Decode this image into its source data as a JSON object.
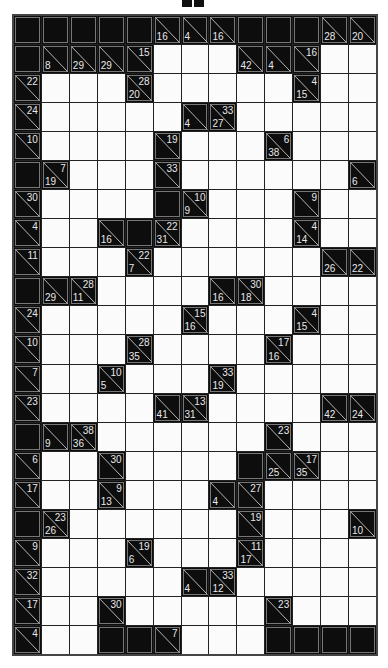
{
  "puzzle": {
    "type": "kakuro",
    "cols": 13,
    "rows": 22,
    "legend": "B = blocked cell, W = empty white cell, {d,r} = clue cell (down sum bottom-left, right sum top-right)",
    "grid": [
      [
        "B",
        "B",
        "B",
        "B",
        "B",
        {
          "d": 16
        },
        {
          "d": 4
        },
        {
          "d": 16
        },
        "B",
        "B",
        "B",
        {
          "d": 28
        },
        {
          "d": 20
        }
      ],
      [
        "B",
        {
          "d": 8
        },
        {
          "d": 29
        },
        {
          "d": 29
        },
        {
          "r": 15
        },
        "W",
        "W",
        "W",
        {
          "d": 42
        },
        {
          "d": 4
        },
        {
          "r": 16
        },
        "W",
        "W"
      ],
      [
        {
          "r": 22
        },
        "W",
        "W",
        "W",
        {
          "d": 20,
          "r": 28
        },
        "W",
        "W",
        "W",
        "W",
        "W",
        {
          "d": 15,
          "r": 4
        },
        "W",
        "W"
      ],
      [
        {
          "r": 24
        },
        "W",
        "W",
        "W",
        "W",
        "W",
        {
          "d": 4
        },
        {
          "d": 27,
          "r": 33
        },
        "W",
        "W",
        "W",
        "W",
        "W"
      ],
      [
        {
          "r": 10
        },
        "W",
        "W",
        "W",
        "W",
        {
          "r": 19
        },
        "W",
        "W",
        "W",
        {
          "d": 38,
          "r": 6
        },
        "W",
        "W",
        "W"
      ],
      [
        "B",
        {
          "d": 19,
          "r": 7
        },
        "W",
        "W",
        "W",
        {
          "r": 33
        },
        "W",
        "W",
        "W",
        "W",
        "W",
        "W",
        {
          "d": 6
        }
      ],
      [
        {
          "r": 30
        },
        "W",
        "W",
        "W",
        "W",
        "B",
        {
          "d": 9,
          "r": 10
        },
        "W",
        "W",
        "W",
        {
          "r": 9
        },
        "W",
        "W"
      ],
      [
        {
          "r": 4
        },
        "W",
        "W",
        {
          "d": 16
        },
        "B",
        {
          "d": 31,
          "r": 22
        },
        "W",
        "W",
        "W",
        "W",
        {
          "d": 14,
          "r": 4
        },
        "W",
        "W"
      ],
      [
        {
          "r": 11
        },
        "W",
        "W",
        "W",
        {
          "d": 7,
          "r": 22
        },
        "W",
        "W",
        "W",
        "W",
        "W",
        "W",
        {
          "d": 26
        },
        {
          "d": 22
        }
      ],
      [
        "B",
        {
          "d": 29
        },
        {
          "d": 11,
          "r": 28
        },
        "W",
        "W",
        "W",
        "W",
        {
          "d": 16
        },
        {
          "d": 18,
          "r": 30
        },
        "W",
        "W",
        "W",
        "W"
      ],
      [
        {
          "r": 24
        },
        "W",
        "W",
        "W",
        "W",
        "W",
        {
          "d": 16,
          "r": 15
        },
        "W",
        "W",
        "W",
        {
          "d": 15,
          "r": 4
        },
        "W",
        "W"
      ],
      [
        {
          "r": 10
        },
        "W",
        "W",
        "W",
        {
          "d": 35,
          "r": 28
        },
        "W",
        "W",
        "W",
        "W",
        {
          "d": 16,
          "r": 17
        },
        "W",
        "W",
        "W"
      ],
      [
        {
          "r": 7
        },
        "W",
        "W",
        {
          "d": 5,
          "r": 10
        },
        "W",
        "W",
        "W",
        {
          "d": 19,
          "r": 33
        },
        "W",
        "W",
        "W",
        "W",
        "W"
      ],
      [
        {
          "r": 23
        },
        "W",
        "W",
        "W",
        "W",
        {
          "d": 41
        },
        {
          "d": 31,
          "r": 13
        },
        "W",
        "W",
        "W",
        "W",
        {
          "d": 42
        },
        {
          "d": 24
        }
      ],
      [
        "B",
        {
          "d": 9
        },
        {
          "d": 36,
          "r": 38
        },
        "W",
        "W",
        "W",
        "W",
        "W",
        "W",
        {
          "r": 23
        },
        "W",
        "W",
        "W"
      ],
      [
        {
          "r": 6
        },
        "W",
        "W",
        {
          "r": 30
        },
        "W",
        "W",
        "W",
        "W",
        "B",
        {
          "d": 25
        },
        {
          "d": 35,
          "r": 17
        },
        "W",
        "W"
      ],
      [
        {
          "r": 17
        },
        "W",
        "W",
        {
          "d": 13,
          "r": 9
        },
        "W",
        "W",
        "W",
        {
          "d": 4
        },
        {
          "r": 27
        },
        "W",
        "W",
        "W",
        "W"
      ],
      [
        "B",
        {
          "d": 26,
          "r": 23
        },
        "W",
        "W",
        "W",
        "W",
        "W",
        "W",
        {
          "r": 19
        },
        "W",
        "W",
        "W",
        {
          "d": 10
        }
      ],
      [
        {
          "r": 9
        },
        "W",
        "W",
        "W",
        {
          "d": 6,
          "r": 19
        },
        "W",
        "W",
        "W",
        {
          "d": 17,
          "r": 11
        },
        "W",
        "W",
        "W",
        "W"
      ],
      [
        {
          "r": 32
        },
        "W",
        "W",
        "W",
        "W",
        "W",
        {
          "d": 4
        },
        {
          "d": 12,
          "r": 33
        },
        "W",
        "W",
        "W",
        "W",
        "W"
      ],
      [
        {
          "r": 17
        },
        "W",
        "W",
        {
          "r": 30
        },
        "W",
        "W",
        "W",
        "W",
        "W",
        {
          "r": 23
        },
        "W",
        "W",
        "W"
      ],
      [
        {
          "r": 4
        },
        "W",
        "W",
        "B",
        "B",
        {
          "r": 7
        },
        "W",
        "W",
        "W",
        "B",
        "B",
        "B",
        "B"
      ]
    ]
  },
  "colors": {
    "blocked": "#0d0d0d",
    "white": "#fbfbfb",
    "clue_text": "#e8e8e8",
    "grid_line": "#222222"
  }
}
